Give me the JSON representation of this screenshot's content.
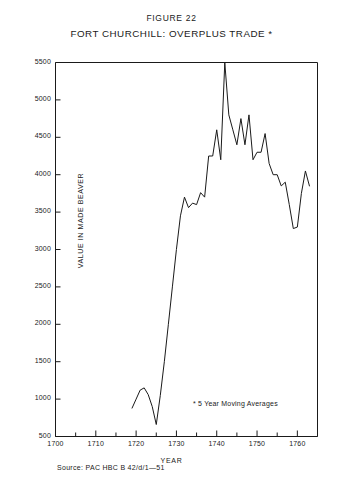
{
  "figure": {
    "number": "FIGURE 22",
    "title": "FORT CHURCHILL: OVERPLUS TRADE *",
    "footnote": "* 5 Year Moving Averages",
    "source": "Source: PAC HBC B 42/d/1—51"
  },
  "chart_data": {
    "type": "line",
    "title": "FORT CHURCHILL: OVERPLUS TRADE *",
    "subtitle": "FIGURE 22",
    "xlabel": "YEAR",
    "ylabel": "VALUE IN MADE BEAVER",
    "xlim": [
      1700,
      1765
    ],
    "ylim": [
      500,
      5500
    ],
    "ytick_step": 500,
    "xtick_step": 10,
    "xminor_step": 5,
    "grid": false,
    "legend": null,
    "line_color": "#1a1a1a",
    "ytick_labels": [
      "5500",
      "5000",
      "4500",
      "4000",
      "3500",
      "3000",
      "2500",
      "2000",
      "1500",
      "1000",
      "500"
    ],
    "xtick_labels": [
      "1700",
      "1710",
      "1720",
      "1730",
      "1740",
      "1750",
      "1760"
    ],
    "series": [
      {
        "name": "Overplus trade (5 year moving average)",
        "x": [
          1719,
          1720,
          1721,
          1722,
          1723,
          1724,
          1725,
          1726,
          1727,
          1728,
          1729,
          1730,
          1731,
          1732,
          1733,
          1734,
          1735,
          1736,
          1737,
          1738,
          1739,
          1740,
          1741,
          1742,
          1743,
          1744,
          1745,
          1746,
          1747,
          1748,
          1749,
          1750,
          1751,
          1752,
          1753,
          1754,
          1755,
          1756,
          1757,
          1758,
          1759,
          1760,
          1761,
          1762,
          1763
        ],
        "values": [
          880,
          1000,
          1120,
          1150,
          1060,
          900,
          660,
          1050,
          1500,
          2000,
          2500,
          3000,
          3450,
          3700,
          3560,
          3620,
          3600,
          3760,
          3700,
          4250,
          4250,
          4600,
          4200,
          5500,
          4800,
          4600,
          4400,
          4750,
          4400,
          4800,
          4200,
          4300,
          4300,
          4550,
          4150,
          4000,
          4000,
          3850,
          3900,
          3600,
          3280,
          3300,
          3750,
          4050,
          3850
        ]
      }
    ]
  },
  "axes": {
    "y_ticks": [
      {
        "label": "5500",
        "value": 5500
      },
      {
        "label": "5000",
        "value": 5000
      },
      {
        "label": "4500",
        "value": 4500
      },
      {
        "label": "4000",
        "value": 4000
      },
      {
        "label": "3500",
        "value": 3500
      },
      {
        "label": "3000",
        "value": 3000
      },
      {
        "label": "2500",
        "value": 2500
      },
      {
        "label": "2000",
        "value": 2000
      },
      {
        "label": "1500",
        "value": 1500
      },
      {
        "label": "1000",
        "value": 1000
      },
      {
        "label": "500",
        "value": 500
      }
    ],
    "x_ticks": [
      {
        "label": "1700",
        "value": 1700
      },
      {
        "label": "1710",
        "value": 1710
      },
      {
        "label": "1720",
        "value": 1720
      },
      {
        "label": "1730",
        "value": 1730
      },
      {
        "label": "1740",
        "value": 1740
      },
      {
        "label": "1750",
        "value": 1750
      },
      {
        "label": "1760",
        "value": 1760
      }
    ]
  }
}
